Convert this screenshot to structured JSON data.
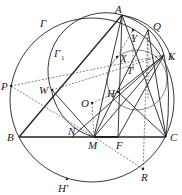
{
  "figure": {
    "type": "geometry-diagram",
    "colors": {
      "ink": "#222222",
      "background": "#ffffff"
    }
  },
  "labels": {
    "Gamma": "Γ",
    "Gamma1": "Γ",
    "Gamma1_sub": "1",
    "A": "A",
    "B": "B",
    "C": "C",
    "M": "M",
    "F": "F",
    "N": "N",
    "K": "K",
    "Q": "Q",
    "Y": "Y",
    "X": "X",
    "T": "T",
    "H": "H",
    "O": "O",
    "W": "W",
    "P": "P",
    "R": "R",
    "Hprime": "H′"
  },
  "points": {
    "A": [
      122,
      15
    ],
    "B": [
      19,
      137
    ],
    "C": [
      166,
      137
    ],
    "M": [
      94,
      137
    ],
    "F": [
      118,
      137
    ],
    "N": [
      72,
      137
    ],
    "K": [
      164,
      55
    ],
    "Q": [
      148,
      30
    ],
    "Y": [
      133,
      30
    ],
    "X": [
      117,
      57
    ],
    "T": [
      127,
      67
    ],
    "H": [
      118,
      92
    ],
    "O": [
      92,
      103
    ],
    "W": [
      52,
      90
    ],
    "P": [
      11,
      86
    ],
    "R": [
      143,
      169
    ],
    "Hprime": [
      67,
      179
    ]
  }
}
